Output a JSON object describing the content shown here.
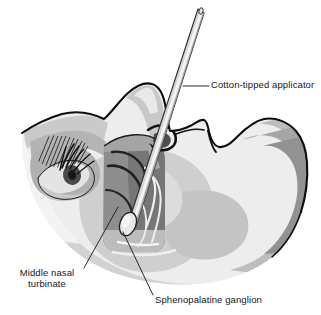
{
  "figure": {
    "background_color": "#ffffff",
    "outline_color": "#111111",
    "width": 321,
    "height": 315
  },
  "labels": {
    "applicator": {
      "text": "Cotton-tipped applicator",
      "position": "upper-right",
      "leader_from": "applicator shaft",
      "color": "#161616"
    },
    "turbinate": {
      "line1": "Middle nasal",
      "line2": "turbinate",
      "position": "lower-left",
      "leader_from": "middle turbinate in nasal cavity",
      "color": "#161616"
    },
    "ganglion": {
      "text": "Sphenopalatine ganglion",
      "position": "lower-right",
      "leader_from": "cotton tip of applicator",
      "color": "#161616"
    }
  },
  "anatomy": {
    "parts": [
      "forehead",
      "eyebrow",
      "eye",
      "eyelashes",
      "nose",
      "nostril",
      "upper lip",
      "cheek",
      "jaw",
      "nasal cavity",
      "middle nasal turbinate",
      "inferior nasal turbinate",
      "sphenopalatine ganglion"
    ]
  },
  "palette": {
    "skin_lightest": "#f2f2f2",
    "skin_light": "#e3e3e3",
    "skin_mid_light": "#d4d4d4",
    "skin_mid": "#c2c2c2",
    "skin_mid_dark": "#ababab",
    "skin_dark": "#939393",
    "skin_darkest": "#7d7d7d",
    "cavity_shadow": "#6e6e6e",
    "applicator_body": "#d9d9d9",
    "applicator_highlight": "#f4f4f4",
    "applicator_shadow": "#9a9a9a",
    "ink": "#111111",
    "leader_line": "#2a2a2a"
  },
  "instrument": {
    "name": "Cotton-tipped applicator",
    "shaft_color": "#d9d9d9",
    "tip_name": "cotton tip",
    "tip_color": "#e8e8e8",
    "entry": "nostril",
    "target": "sphenopalatine ganglion"
  }
}
